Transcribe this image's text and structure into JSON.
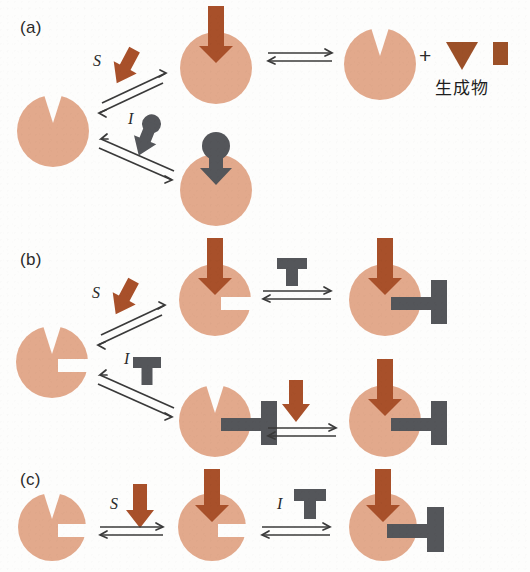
{
  "figure": {
    "type": "biochemistry-diagram",
    "width": 530,
    "height": 572,
    "background_color": "#fdfdfc"
  },
  "colors": {
    "enzyme_fill": "#e2a98c",
    "substrate_brown": "#a8502a",
    "inhibitor_gray": "#54565a",
    "product_brown": "#9c5028",
    "text_black": "#2b2b2b",
    "arrow_line": "#3a3a3a"
  },
  "panels": [
    {
      "id": "a",
      "label": "(a)",
      "mechanism": "competitive-inhibition",
      "labels": {
        "substrate": "S",
        "inhibitor": "I"
      },
      "nodes": [
        {
          "name": "free-enzyme",
          "desc": "enzyme with V-shaped active site notch"
        },
        {
          "name": "enzyme-substrate-complex",
          "desc": "enzyme with brown substrate arrow bound in notch"
        },
        {
          "name": "free-enzyme-after-catalysis",
          "desc": "enzyme with empty V notch"
        },
        {
          "name": "enzyme-inhibitor-complex",
          "desc": "enzyme with gray round-headed inhibitor bound in notch"
        }
      ],
      "products": {
        "plus": "+",
        "label": "生成物",
        "items": [
          {
            "name": "product-triangle",
            "shape": "triangle-down"
          },
          {
            "name": "product-rectangle",
            "shape": "rectangle"
          }
        ]
      }
    },
    {
      "id": "b",
      "label": "(b)",
      "mechanism": "non-competitive-inhibition",
      "labels": {
        "substrate": "S",
        "inhibitor": "I"
      },
      "nodes": [
        {
          "name": "free-enzyme",
          "desc": "enzyme with V notch and side allosteric slot"
        },
        {
          "name": "enzyme-substrate-complex",
          "desc": "substrate bound, side slot free"
        },
        {
          "name": "enzyme-substrate-inhibitor-complex",
          "desc": "substrate and T-inhibitor both bound"
        },
        {
          "name": "enzyme-inhibitor-complex",
          "desc": "T-inhibitor bound at side slot, V notch free"
        },
        {
          "name": "enzyme-inhibitor-substrate-complex",
          "desc": "inhibitor bound then substrate bound"
        }
      ]
    },
    {
      "id": "c",
      "label": "(c)",
      "mechanism": "uncompetitive-inhibition",
      "labels": {
        "substrate": "S",
        "inhibitor": "I"
      },
      "nodes": [
        {
          "name": "free-enzyme",
          "desc": "enzyme with V notch and side slot"
        },
        {
          "name": "enzyme-substrate-complex",
          "desc": "substrate bound in V notch, side slot open"
        },
        {
          "name": "enzyme-substrate-inhibitor-complex",
          "desc": "substrate plus T-inhibitor bound at side slot"
        }
      ]
    }
  ]
}
